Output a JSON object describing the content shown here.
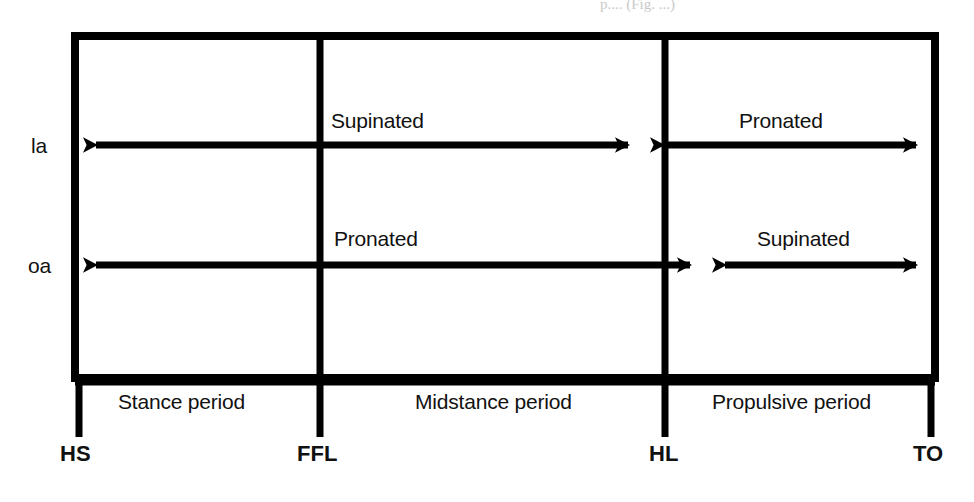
{
  "figure": {
    "type": "gait-cycle-timeline-diagram",
    "colors": {
      "ink": "#000000",
      "paper": "#ffffff"
    },
    "top_artifact_text": "p.... (Fig. ...)"
  },
  "rows": [
    {
      "id": "la",
      "label": "la",
      "segments": [
        {
          "label": "Supinated",
          "from_tick": "HS",
          "to_tick": "HL",
          "direction": "double"
        },
        {
          "label": "Pronated",
          "from_tick": "HL",
          "to_tick": "TO",
          "direction": "double"
        }
      ]
    },
    {
      "id": "oa",
      "label": "oa",
      "segments": [
        {
          "label": "Pronated",
          "from_tick": "HS",
          "to_tick": "HL",
          "direction": "double"
        },
        {
          "label": "Supinated",
          "from_tick": "HL",
          "to_tick": "TO",
          "direction": "double"
        }
      ]
    }
  ],
  "periods": [
    {
      "label": "Stance period",
      "start_tick": "HS",
      "end_tick": "FFL"
    },
    {
      "label": "Midstance period",
      "start_tick": "FFL",
      "end_tick": "HL"
    },
    {
      "label": "Propulsive period",
      "start_tick": "HL",
      "end_tick": "TO"
    }
  ],
  "ticks": [
    {
      "label": "HS"
    },
    {
      "label": "FFL"
    },
    {
      "label": "HL"
    },
    {
      "label": "TO"
    }
  ]
}
